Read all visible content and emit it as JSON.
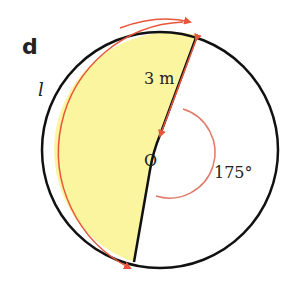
{
  "figure": {
    "part_label": "d",
    "arc_label": "l",
    "radius_label": "3 m",
    "center_label": "O",
    "angle_label": "175°"
  },
  "colors": {
    "sector_fill": "#fbf5a0",
    "outline": "#111111",
    "annotation": "#e8553a",
    "angle_arc": "#e07a6a"
  },
  "geometry": {
    "radius_m": 3,
    "reflex_angle_deg": 175,
    "shaded_region": "minor-segment side opposite the marked 175° angle"
  }
}
